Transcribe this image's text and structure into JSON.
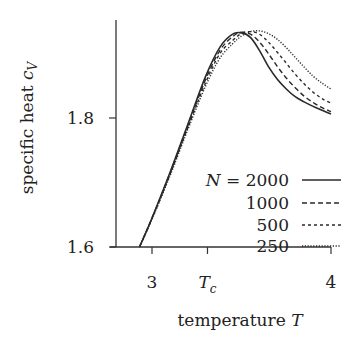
{
  "chart_data": {
    "type": "line",
    "title": "",
    "xlabel": "temperature T",
    "ylabel": "specific heat c_V",
    "xlabel_parts": {
      "text": "temperature ",
      "var": "T"
    },
    "ylabel_parts": {
      "text": "specific heat ",
      "var": "c",
      "sub": "V"
    },
    "xlim": [
      2.64,
      4.0
    ],
    "ylim": [
      1.6,
      1.95
    ],
    "x_ticks": [
      {
        "value": 3,
        "label": "3"
      },
      {
        "value": 3.31,
        "label": "T",
        "sub": "c"
      },
      {
        "value": 4,
        "label": "4"
      }
    ],
    "y_ticks": [
      {
        "value": 1.6,
        "label": "1.6"
      },
      {
        "value": 1.8,
        "label": "1.8"
      }
    ],
    "grid": false,
    "legend": {
      "position": "lower right",
      "prefix": "N = ",
      "entries": [
        "2000",
        "1000",
        "500",
        "250"
      ]
    },
    "series": [
      {
        "name": "N = 2000",
        "style": "solid",
        "x": [
          2.93,
          3.0,
          3.1,
          3.2,
          3.3,
          3.38,
          3.45,
          3.5,
          3.55,
          3.6,
          3.65,
          3.7,
          3.75,
          3.8,
          3.85,
          3.9,
          3.95,
          4.0
        ],
        "y": [
          1.6,
          1.645,
          1.715,
          1.79,
          1.865,
          1.91,
          1.93,
          1.932,
          1.925,
          1.905,
          1.88,
          1.86,
          1.845,
          1.833,
          1.825,
          1.818,
          1.812,
          1.806
        ]
      },
      {
        "name": "N = 1000",
        "style": "dashed",
        "x": [
          2.93,
          3.0,
          3.1,
          3.2,
          3.3,
          3.38,
          3.45,
          3.5,
          3.55,
          3.6,
          3.65,
          3.7,
          3.75,
          3.8,
          3.85,
          3.9,
          3.95,
          4.0
        ],
        "y": [
          1.6,
          1.645,
          1.714,
          1.788,
          1.86,
          1.905,
          1.926,
          1.933,
          1.93,
          1.918,
          1.9,
          1.88,
          1.862,
          1.847,
          1.834,
          1.824,
          1.816,
          1.81
        ]
      },
      {
        "name": "N = 500",
        "style": "dotted-dashed",
        "x": [
          2.93,
          3.0,
          3.1,
          3.2,
          3.3,
          3.38,
          3.45,
          3.5,
          3.55,
          3.6,
          3.65,
          3.7,
          3.75,
          3.8,
          3.85,
          3.9,
          3.95,
          4.0
        ],
        "y": [
          1.6,
          1.644,
          1.712,
          1.785,
          1.855,
          1.9,
          1.92,
          1.931,
          1.934,
          1.93,
          1.918,
          1.902,
          1.885,
          1.868,
          1.853,
          1.84,
          1.83,
          1.823
        ]
      },
      {
        "name": "N = 250",
        "style": "dotted",
        "x": [
          2.93,
          3.0,
          3.1,
          3.2,
          3.3,
          3.38,
          3.45,
          3.5,
          3.55,
          3.6,
          3.65,
          3.7,
          3.75,
          3.8,
          3.85,
          3.9,
          3.95,
          4.0
        ],
        "y": [
          1.6,
          1.643,
          1.71,
          1.782,
          1.85,
          1.893,
          1.915,
          1.927,
          1.934,
          1.935,
          1.931,
          1.922,
          1.909,
          1.894,
          1.879,
          1.865,
          1.854,
          1.845
        ]
      }
    ]
  }
}
